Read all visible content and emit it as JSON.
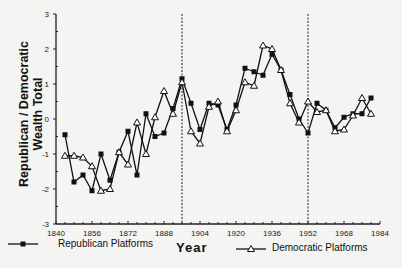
{
  "chart_data": {
    "type": "line",
    "title": "",
    "xlabel": "Year",
    "ylabel": "Republican / Democratic Wealth Total",
    "ylabel_lines": [
      "Republican  /  Democratic",
      "Wealth Total"
    ],
    "xlim": [
      1840,
      1984
    ],
    "ylim": [
      -3,
      3
    ],
    "x_ticks": [
      1840,
      1856,
      1872,
      1888,
      1904,
      1920,
      1936,
      1952,
      1968,
      1984
    ],
    "y_ticks": [
      3,
      2,
      1,
      0,
      -1,
      -2,
      -3
    ],
    "grid": false,
    "vertical_reference_lines": [
      1896,
      1952
    ],
    "legend_position": "bottom",
    "x": [
      1844,
      1848,
      1852,
      1856,
      1860,
      1864,
      1868,
      1872,
      1876,
      1880,
      1884,
      1888,
      1892,
      1896,
      1900,
      1904,
      1908,
      1912,
      1916,
      1920,
      1924,
      1928,
      1932,
      1936,
      1940,
      1944,
      1948,
      1952,
      1956,
      1960,
      1964,
      1968,
      1972,
      1976,
      1980
    ],
    "series": [
      {
        "name": "Republican Platforms",
        "marker": "square",
        "values": [
          -0.45,
          -1.8,
          -1.6,
          -2.05,
          -1.0,
          -1.75,
          -0.95,
          -0.35,
          -1.6,
          0.15,
          -0.5,
          -0.4,
          0.3,
          1.15,
          0.45,
          -0.3,
          0.45,
          0.4,
          -0.3,
          0.4,
          1.45,
          1.35,
          1.25,
          1.85,
          1.4,
          0.7,
          0.0,
          -0.4,
          0.45,
          0.25,
          -0.25,
          0.05,
          0.15,
          0.15,
          0.6
        ]
      },
      {
        "name": "Democratic Platforms",
        "marker": "triangle",
        "values": [
          -1.05,
          -1.05,
          -1.1,
          -1.35,
          -2.05,
          -2.0,
          -0.95,
          -1.3,
          -0.1,
          -1.0,
          0.05,
          0.8,
          0.15,
          1.05,
          -0.35,
          -0.7,
          0.35,
          0.5,
          -0.35,
          0.25,
          1.05,
          0.95,
          2.1,
          2.0,
          1.4,
          0.45,
          -0.1,
          0.5,
          0.2,
          0.25,
          -0.35,
          -0.3,
          0.1,
          0.6,
          0.15
        ]
      }
    ]
  },
  "labels": {
    "ylabel_line1": "Republican  /  Democratic",
    "ylabel_line2": "Wealth Total",
    "xlabel": "Year",
    "legend_republican": "Republican Platforms",
    "legend_democratic": "Democratic Platforms"
  }
}
